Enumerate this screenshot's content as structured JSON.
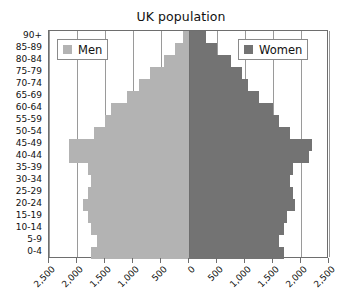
{
  "chart_data": {
    "type": "bar",
    "subtype": "population-pyramid",
    "title": "UK population",
    "xlabel": "",
    "ylabel": "",
    "categories": [
      "90+",
      "85-89",
      "80-84",
      "75-79",
      "70-74",
      "65-69",
      "60-64",
      "55-59",
      "50-54",
      "45-49",
      "40-44",
      "35-39",
      "30-34",
      "25-29",
      "20-24",
      "15-19",
      "10-14",
      "5-9",
      "0-4"
    ],
    "series": [
      {
        "name": "Men",
        "color": "#b3b3b3",
        "direction": "left",
        "values": [
          100,
          250,
          450,
          700,
          900,
          1100,
          1400,
          1500,
          1700,
          2150,
          2150,
          1800,
          1750,
          1800,
          1900,
          1800,
          1750,
          1650,
          1750
        ]
      },
      {
        "name": "Women",
        "color": "#737373",
        "direction": "right",
        "values": [
          300,
          500,
          750,
          950,
          1050,
          1250,
          1500,
          1600,
          1800,
          2200,
          2150,
          1850,
          1800,
          1850,
          1900,
          1750,
          1700,
          1600,
          1700
        ]
      }
    ],
    "xlim": [
      -2500,
      2500
    ],
    "x_ticks": [
      -2500,
      -2000,
      -1500,
      -1000,
      -500,
      0,
      500,
      1000,
      1500,
      2000,
      2500
    ],
    "x_tick_labels": [
      "2,500",
      "2,000",
      "1,500",
      "1,000",
      "500",
      "0",
      "500",
      "1,000",
      "1,500",
      "2,000",
      "2,500"
    ],
    "grid": true,
    "legend_position": "inside-top-left-and-top-right"
  },
  "legend": {
    "men": {
      "label": "Men",
      "color": "#b3b3b3"
    },
    "women": {
      "label": "Women",
      "color": "#737373"
    }
  },
  "colors": {
    "men": "#b3b3b3",
    "women": "#737373",
    "axis": "#6e6e6e",
    "grid": "#9a9a9a",
    "background": "#ffffff"
  }
}
